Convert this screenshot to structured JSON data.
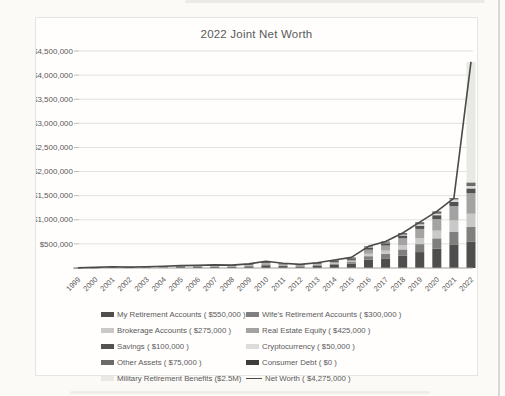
{
  "page": {
    "background": "#fbfaf7",
    "frame_background": "#fffefd",
    "frame_border": "#e6e5e1"
  },
  "chart_style": {
    "text_color": "#5a5a5a",
    "gridline_color": "#e1e1dd",
    "tick_color": "#bcbcb8",
    "axis_color": "#9b9b97",
    "line_color": "#4a4a4a"
  },
  "chart_data": {
    "type": "stacked-bar-line-combo",
    "title": "2022 Joint Net Worth",
    "xlabel": "",
    "ylabel": "",
    "x": [
      "1999",
      "2000",
      "2001",
      "2002",
      "2003",
      "2004",
      "2005",
      "2006",
      "2007",
      "2008",
      "2009",
      "2010",
      "2011",
      "2012",
      "2013",
      "2014",
      "2015",
      "2016",
      "2017",
      "2018",
      "2019",
      "2020",
      "2021",
      "2022"
    ],
    "ylim": [
      0,
      4500000
    ],
    "ytick_step": 500000,
    "yticks": [
      "$500,000",
      "$1,000,000",
      "$1,500,000",
      "$2,000,000",
      "$2,500,000",
      "$3,000,000",
      "$3,500,000",
      "$4,000,000",
      "$4,500,000"
    ],
    "grid": true,
    "legend_position": "bottom",
    "series": [
      {
        "name": "my-retirement-accounts",
        "legend": "My Retirement Accounts ( $550,000 )",
        "color": "#4e4e4e",
        "values": [
          2000,
          5000,
          10000,
          7000,
          10000,
          14000,
          20000,
          22000,
          26000,
          24000,
          34000,
          56000,
          40000,
          30000,
          44000,
          66000,
          88000,
          170000,
          200000,
          260000,
          330000,
          405000,
          490000,
          550000
        ]
      },
      {
        "name": "wifes-retirement-accounts",
        "legend": "Wife's Retirement Accounts ( $300,000 )",
        "color": "#7f7f7f",
        "values": [
          0,
          1000,
          3000,
          2000,
          3000,
          5000,
          7000,
          8000,
          10000,
          9000,
          13000,
          22000,
          16000,
          12000,
          17000,
          26000,
          35000,
          75000,
          95000,
          125000,
          165000,
          210000,
          265000,
          300000
        ]
      },
      {
        "name": "brokerage-accounts",
        "legend": "Brokerage Accounts ( $275,000 )",
        "color": "#c9c9c9",
        "values": [
          0,
          0,
          1000,
          1000,
          1000,
          2000,
          3000,
          3000,
          4000,
          3000,
          5000,
          8000,
          6000,
          4000,
          6000,
          10000,
          13000,
          50000,
          65000,
          90000,
          125000,
          160000,
          230000,
          275000
        ]
      },
      {
        "name": "real-estate-equity",
        "legend": "Real Estate Equity ( $425,000 )",
        "color": "#a3a3a3",
        "values": [
          0,
          1000,
          3000,
          2000,
          3000,
          4000,
          6000,
          7000,
          8000,
          8000,
          12000,
          20000,
          14000,
          11000,
          16000,
          24000,
          32000,
          85000,
          105000,
          140000,
          190000,
          240000,
          300000,
          425000
        ]
      },
      {
        "name": "savings",
        "legend": "Savings ( $100,000 )",
        "color": "#525252",
        "values": [
          2000,
          4000,
          6000,
          4000,
          6000,
          7000,
          10000,
          10000,
          11000,
          10000,
          13000,
          21000,
          15000,
          11000,
          16000,
          24000,
          32000,
          45000,
          50000,
          60000,
          70000,
          80000,
          90000,
          100000
        ]
      },
      {
        "name": "cryptocurrency",
        "legend": "Cryptocurrency ( $50,000 )",
        "color": "#dcdcdc",
        "values": [
          0,
          0,
          0,
          0,
          0,
          0,
          0,
          0,
          0,
          0,
          0,
          0,
          0,
          0,
          0,
          0,
          0,
          5000,
          10000,
          15000,
          25000,
          30000,
          45000,
          50000
        ]
      },
      {
        "name": "other-assets",
        "legend": "Other Assets ( $75,000 )",
        "color": "#6a6a6a",
        "values": [
          1000,
          1000,
          2000,
          2000,
          2000,
          3000,
          4000,
          5000,
          6000,
          6000,
          8000,
          13000,
          9000,
          7000,
          11000,
          15000,
          20000,
          20000,
          25000,
          35000,
          45000,
          50000,
          30000,
          75000
        ]
      },
      {
        "name": "consumer-debt",
        "legend": "Consumer Debt ( $0 )",
        "color": "#3d3d3d",
        "values": [
          0,
          0,
          0,
          0,
          0,
          0,
          0,
          0,
          0,
          0,
          0,
          0,
          0,
          0,
          0,
          0,
          0,
          0,
          0,
          0,
          0,
          0,
          0,
          0
        ]
      },
      {
        "name": "military-retirement-benefits",
        "legend": "Military Retirement Benefits ($2.5M)",
        "color": "#e8e8e4",
        "values": [
          0,
          0,
          0,
          0,
          0,
          0,
          0,
          0,
          0,
          0,
          0,
          0,
          0,
          0,
          0,
          0,
          0,
          0,
          0,
          0,
          0,
          0,
          0,
          2500000
        ]
      }
    ],
    "line": {
      "name": "net-worth",
      "legend": "Net Worth ( $4,275,000 )",
      "color": "#4a4a4a",
      "values": [
        5000,
        12000,
        25000,
        18000,
        25000,
        35000,
        50000,
        55000,
        65000,
        60000,
        85000,
        140000,
        100000,
        75000,
        110000,
        165000,
        220000,
        450000,
        550000,
        725000,
        950000,
        1175000,
        1450000,
        4275000
      ]
    }
  }
}
